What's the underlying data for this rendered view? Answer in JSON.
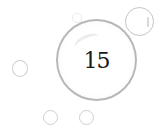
{
  "level": {
    "number": "15"
  },
  "colors": {
    "background": "#ffffff",
    "bubble_outline": "#b8b8b8",
    "text": "#1a1a1a"
  },
  "decorations": {
    "bubbles": [
      "top-right-bubble",
      "left-bubble",
      "bottom-left-bubble",
      "bottom-center-bubble",
      "tiny-top-bubble"
    ]
  }
}
